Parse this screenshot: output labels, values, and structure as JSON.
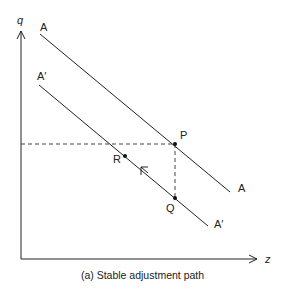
{
  "diagram": {
    "caption": "(a) Stable adjustment path",
    "axes": {
      "y_label": "q",
      "x_label": "z"
    },
    "lines": [
      {
        "name": "A",
        "label_start": "A",
        "label_end": "A"
      },
      {
        "name": "A'",
        "label_start": "A′",
        "label_end": "A′"
      }
    ],
    "points": [
      {
        "label": "P"
      },
      {
        "label": "Q"
      },
      {
        "label": "R"
      }
    ],
    "colors": {
      "line": "#222222",
      "dashed": "#444444",
      "background": "#ffffff"
    }
  }
}
